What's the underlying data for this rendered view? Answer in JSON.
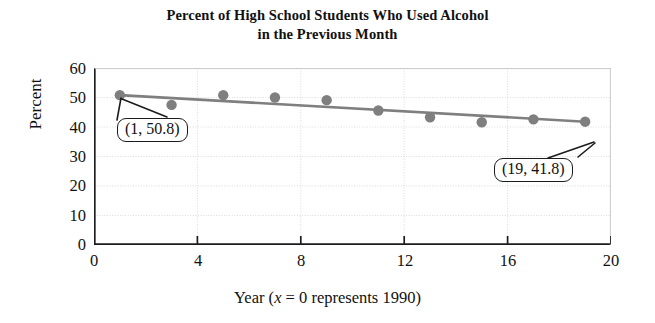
{
  "title": {
    "line1": "Percent of High School Students Who Used Alcohol",
    "line2": "in the Previous Month"
  },
  "axes": {
    "ylabel": "Percent",
    "xlabel_prefix": "Year (",
    "xlabel_var": "x",
    "xlabel_suffix": " = 0 represents 1990)",
    "yticks": [
      "0",
      "10",
      "20",
      "30",
      "40",
      "50",
      "60"
    ],
    "xticks": [
      "0",
      "4",
      "8",
      "12",
      "16",
      "20"
    ]
  },
  "annotations": [
    {
      "name": "first-point-callout",
      "text": "(1, 50.8)"
    },
    {
      "name": "last-point-callout",
      "text": "(19, 41.8)"
    }
  ],
  "colors": {
    "marker": "#7f7f7f",
    "line": "#7f7f7f",
    "axis": "#1c1c1c",
    "grid": "#d8d8d8",
    "text": "#111111"
  },
  "chart_data": {
    "type": "scatter",
    "title": "Percent of High School Students Who Used Alcohol in the Previous Month",
    "xlabel": "Year (x = 0 represents 1990)",
    "ylabel": "Percent",
    "xlim": [
      0,
      20
    ],
    "ylim": [
      0,
      60
    ],
    "xticks": [
      0,
      4,
      8,
      12,
      16,
      20
    ],
    "yticks": [
      0,
      10,
      20,
      30,
      40,
      50,
      60
    ],
    "grid": true,
    "legend": "none",
    "x": [
      1,
      3,
      5,
      7,
      9,
      11,
      13,
      15,
      17,
      19
    ],
    "values": [
      50.8,
      47.5,
      50.8,
      50.0,
      49.1,
      45.6,
      43.3,
      41.6,
      42.6,
      41.8
    ],
    "series": [
      {
        "name": "Percent of students who used alcohol",
        "type": "scatter",
        "x": [
          1,
          3,
          5,
          7,
          9,
          11,
          13,
          15,
          17,
          19
        ],
        "values": [
          50.8,
          47.5,
          50.8,
          50.0,
          49.1,
          45.6,
          43.3,
          41.6,
          42.6,
          41.8
        ]
      },
      {
        "name": "Line of best fit",
        "type": "line",
        "x": [
          1,
          19
        ],
        "values": [
          50.8,
          41.8
        ]
      }
    ],
    "annotations": [
      {
        "label": "(1, 50.8)",
        "x": 1,
        "y": 50.8
      },
      {
        "label": "(19, 41.8)",
        "x": 19,
        "y": 41.8
      }
    ]
  }
}
